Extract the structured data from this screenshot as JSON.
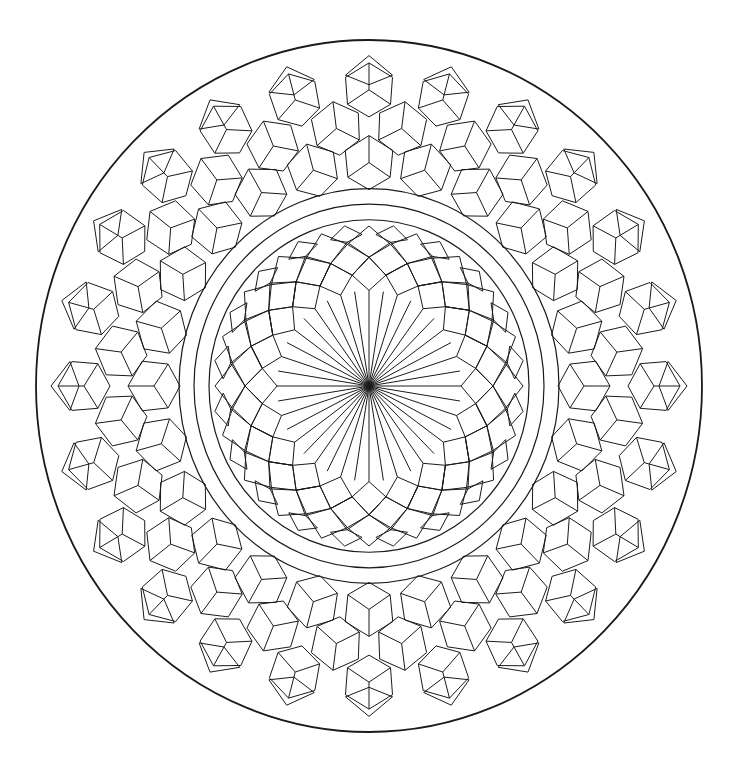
{
  "figure": {
    "colors": {
      "background": "#ffffff",
      "stroke": "#1a1a1a"
    },
    "geometry": {
      "center": [
        369,
        386
      ],
      "outer_circle_radius": [
        333,
        346
      ],
      "rings_radii": [
        160,
        175,
        190
      ],
      "spokes": 40,
      "inner_fold": 20,
      "outer_fold": 24
    }
  }
}
